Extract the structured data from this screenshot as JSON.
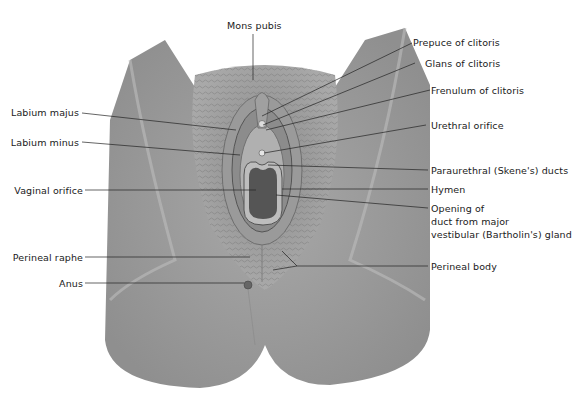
{
  "figure": {
    "type": "anatomical-illustration"
  },
  "labels": {
    "top": {
      "mons_pubis": "Mons pubis"
    },
    "left": [
      {
        "id": "labium-majus",
        "text": "Labium majus"
      },
      {
        "id": "labium-minus",
        "text": "Labium minus"
      },
      {
        "id": "vaginal-orifice",
        "text": "Vaginal orifice"
      },
      {
        "id": "perineal-raphe",
        "text": "Perineal raphe"
      },
      {
        "id": "anus",
        "text": "Anus"
      }
    ],
    "right": [
      {
        "id": "prepuce-of-clitoris",
        "text": "Prepuce of clitoris"
      },
      {
        "id": "glans-of-clitoris",
        "text": "Glans of clitoris"
      },
      {
        "id": "frenulum-of-clitoris",
        "text": "Frenulum of clitoris"
      },
      {
        "id": "urethral-orifice",
        "text": "Urethral orifice"
      },
      {
        "id": "paraurethral-ducts",
        "text": "Paraurethral (Skene's) ducts"
      },
      {
        "id": "hymen",
        "text": "Hymen"
      },
      {
        "id": "bartholin-line1",
        "text": "Opening of"
      },
      {
        "id": "bartholin-line2",
        "text": "duct from major"
      },
      {
        "id": "bartholin-line3",
        "text": "vestibular (Bartholin's) gland"
      },
      {
        "id": "perineal-body",
        "text": "Perineal body"
      }
    ]
  },
  "colors": {
    "skin": "#9c9c9c",
    "skin_light": "#b3b3b3",
    "hair": "#7a7a7a",
    "inner": "#5a5a5a",
    "leader_line": "#222222",
    "text": "#1a1a1a"
  }
}
